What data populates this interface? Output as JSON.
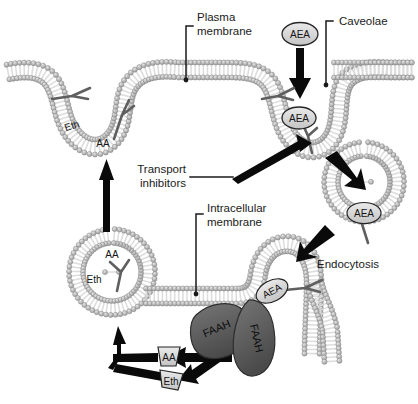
{
  "figure": {
    "background_color": "#ffffff",
    "width": 418,
    "height": 404
  },
  "palette": {
    "membrane_head": "#a9a9a9",
    "membrane_head_light": "#c9c9c9",
    "membrane_tail": "#dcdcdc",
    "membrane_outline": "#8c8c8c",
    "faah_fill": "#5e5e5e",
    "faah_outline": "#2b2b2b",
    "molecule_fill": "#d7d7d7",
    "molecule_outline": "#2a2a2a",
    "arrow_black": "#0a0a0a",
    "text_black": "#1a1a1a",
    "tail_gray": "#6e6e6e"
  },
  "labels": {
    "plasma_membrane": {
      "line1": "Plasma",
      "line2": "membrane"
    },
    "caveolae": {
      "line1": "Caveolae"
    },
    "transport_inhibitors": {
      "line1": "Transport",
      "line2": "inhibitors"
    },
    "intracellular_membrane": {
      "line1": "Intracellular",
      "line2": "membrane"
    },
    "endocytosis": {
      "line1": "Endocytosis"
    }
  },
  "molecules": {
    "aea_extracellular": "AEA",
    "aea_membrane": "AEA",
    "aea_vesicle": "AEA",
    "aea_intracellular": "AEA",
    "eth_plasma": "Eth",
    "aa_plasma": "AA",
    "aa_vesicle": "AA",
    "eth_vesicle": "Eth",
    "aa_product": "AA",
    "eth_product": "Eth"
  },
  "enzymes": {
    "faah_left": "FAAH",
    "faah_right": "FAAH"
  },
  "arrows": [
    {
      "name": "aea-uptake-arrow",
      "from": "AEA extracellular",
      "to": "plasma membrane caveola"
    },
    {
      "name": "endocytosis-arrow",
      "from": "caveola",
      "to": "endocytic vesicle"
    },
    {
      "name": "vesicle-to-intracellular-arrow",
      "from": "endocytic vesicle",
      "to": "intracellular membrane"
    },
    {
      "name": "aa-release-arrow",
      "from": "FAAH",
      "to": "AA"
    },
    {
      "name": "eth-release-arrow",
      "from": "FAAH",
      "to": "Eth"
    },
    {
      "name": "aa-to-vesicle-arrow",
      "from": "AA",
      "to": "recycling vesicle"
    },
    {
      "name": "eth-to-vesicle-arrow",
      "from": "Eth",
      "to": "recycling vesicle"
    },
    {
      "name": "vesicle-to-plasma-arrow",
      "from": "recycling vesicle",
      "to": "plasma membrane"
    }
  ]
}
